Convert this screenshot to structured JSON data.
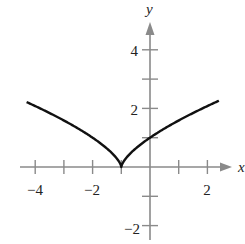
{
  "chart_data": {
    "type": "line",
    "title": "",
    "xlabel": "x",
    "ylabel": "y",
    "function": "y = |x + 1|^(2/3)",
    "xlim": [
      -4.5,
      2.8
    ],
    "ylim": [
      -2.6,
      5.4
    ],
    "grid": false,
    "legend": null,
    "x_ticks": [
      -4,
      -3,
      -2,
      -1,
      1,
      2
    ],
    "x_tick_labels": [
      {
        "value": -4,
        "label": "−4"
      },
      {
        "value": -2,
        "label": "−2"
      },
      {
        "value": 2,
        "label": "2"
      }
    ],
    "y_ticks": [
      -2,
      -1,
      1,
      2,
      3,
      4
    ],
    "y_tick_labels": [
      {
        "value": 4,
        "label": "4"
      },
      {
        "value": 2,
        "label": "2"
      },
      {
        "value": -2,
        "label": "−2"
      }
    ],
    "series": [
      {
        "name": "f(x)",
        "color": "#111111",
        "x": [
          -4.3,
          -4,
          -3.5,
          -3,
          -2.5,
          -2,
          -1.5,
          -1.2,
          -1,
          -0.8,
          -0.5,
          0,
          0.5,
          1,
          1.5,
          2,
          2.4
        ],
        "y": [
          2.22,
          2.08,
          1.84,
          1.59,
          1.31,
          1.0,
          0.63,
          0.34,
          0.0,
          0.34,
          0.63,
          1.0,
          1.31,
          1.59,
          1.84,
          2.08,
          2.26
        ]
      }
    ],
    "annotations": [
      "cusp at (-1, 0)"
    ]
  },
  "labels": {
    "x_axis": "x",
    "y_axis": "y",
    "xt_m4": "−4",
    "xt_m2": "−2",
    "xt_2": "2",
    "yt_4": "4",
    "yt_2": "2",
    "yt_m2": "−2"
  },
  "colors": {
    "axis": "#8a8a8a",
    "curve": "#111111",
    "text": "#222222"
  }
}
